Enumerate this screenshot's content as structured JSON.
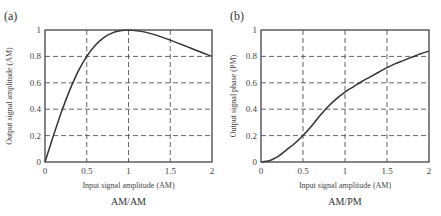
{
  "chart_data": [
    {
      "type": "line",
      "panel": "(a)",
      "title": "AM/AM",
      "xlabel": "Input signal amplitude (AM)",
      "ylabel": "Output signal amplitude (AM)",
      "xlim": [
        0,
        2
      ],
      "ylim": [
        0,
        1
      ],
      "xticks": [
        "0",
        "0.5",
        "1",
        "1.5",
        "2"
      ],
      "yticks": [
        "0",
        "0.2",
        "0.4",
        "0.6",
        "0.8",
        "1"
      ],
      "grid": true,
      "x": [
        0,
        0.1,
        0.2,
        0.3,
        0.4,
        0.5,
        0.6,
        0.7,
        0.8,
        0.9,
        1.0,
        1.1,
        1.2,
        1.3,
        1.4,
        1.5,
        1.6,
        1.7,
        1.8,
        1.9,
        2.0
      ],
      "series": [
        {
          "name": "AM/AM",
          "values": [
            0,
            0.198,
            0.385,
            0.55,
            0.69,
            0.8,
            0.882,
            0.94,
            0.976,
            0.994,
            1.0,
            0.995,
            0.984,
            0.967,
            0.946,
            0.923,
            0.899,
            0.874,
            0.849,
            0.824,
            0.8
          ]
        }
      ]
    },
    {
      "type": "line",
      "panel": "(b)",
      "title": "AM/PM",
      "xlabel": "Input signal amplitude (AM)",
      "ylabel": "Output signal phase (PM)",
      "xlim": [
        0,
        2
      ],
      "ylim": [
        0,
        1
      ],
      "xticks": [
        "0",
        "0.5",
        "1",
        "1.5",
        "2"
      ],
      "yticks": [
        "0",
        "0.2",
        "0.4",
        "0.6",
        "0.8",
        "1"
      ],
      "grid": true,
      "x": [
        0,
        0.1,
        0.2,
        0.3,
        0.4,
        0.5,
        0.6,
        0.7,
        0.8,
        0.9,
        1.0,
        1.1,
        1.2,
        1.3,
        1.4,
        1.5,
        1.6,
        1.7,
        1.8,
        1.9,
        2.0
      ],
      "series": [
        {
          "name": "AM/PM",
          "values": [
            0,
            0.01,
            0.04,
            0.09,
            0.14,
            0.2,
            0.27,
            0.35,
            0.42,
            0.48,
            0.53,
            0.57,
            0.61,
            0.645,
            0.68,
            0.715,
            0.745,
            0.77,
            0.795,
            0.82,
            0.84
          ]
        }
      ]
    }
  ]
}
